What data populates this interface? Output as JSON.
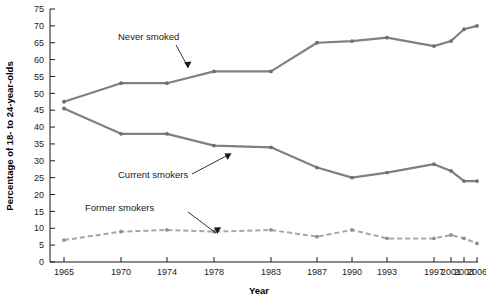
{
  "chart_data": {
    "type": "line",
    "title": "",
    "xlabel": "Year",
    "ylabel": "Percentage of 18- to 24-year-olds",
    "categories": [
      "1965",
      "1970",
      "1974",
      "1978",
      "1983",
      "1987",
      "1990",
      "1993",
      "1997",
      "2001",
      "2003",
      "2006"
    ],
    "ylim": [
      0,
      75
    ],
    "yticks": [
      0,
      5,
      10,
      15,
      20,
      25,
      30,
      35,
      40,
      45,
      50,
      55,
      60,
      65,
      70,
      75
    ],
    "grid": false,
    "legend_position": "inline-annotations",
    "series": [
      {
        "name": "Never smoked",
        "style": "solid",
        "color": "#808080",
        "values": [
          47.5,
          53,
          53,
          56.5,
          56.5,
          65,
          65.5,
          66.5,
          64,
          65.5,
          69,
          70
        ]
      },
      {
        "name": "Current smokers",
        "style": "solid",
        "color": "#808080",
        "values": [
          45.5,
          38,
          38,
          34.5,
          34,
          28,
          25,
          26.5,
          29,
          27,
          24,
          24
        ]
      },
      {
        "name": "Former smokers",
        "style": "dashed",
        "color": "#a6a6a6",
        "values": [
          6.5,
          9,
          9.5,
          9,
          9.5,
          7.5,
          9.5,
          7,
          7,
          8,
          7,
          5.5
        ]
      }
    ],
    "annotations": [
      {
        "text": "Never smoked",
        "series": "Never smoked",
        "points_to_year": "1983"
      },
      {
        "text": "Current smokers",
        "series": "Current smokers",
        "points_to_year": "1983"
      },
      {
        "text": "Former smokers",
        "series": "Former smokers",
        "points_to_year": "1983"
      }
    ]
  },
  "axis": {
    "x_title": "Year",
    "y_title": "Percentage of 18- to 24-year-olds"
  },
  "ticks": {
    "y": [
      "0",
      "5",
      "10",
      "15",
      "20",
      "25",
      "30",
      "35",
      "40",
      "45",
      "50",
      "55",
      "60",
      "65",
      "70",
      "75"
    ],
    "x": [
      "1965",
      "1970",
      "1974",
      "1978",
      "1983",
      "1987",
      "1990",
      "1993",
      "1997",
      "2001",
      "2003",
      "2006"
    ]
  },
  "labels": {
    "never": "Never smoked",
    "current": "Current smokers",
    "former": "Former smokers"
  },
  "colors": {
    "solid_line": "#808080",
    "dashed_line": "#a6a6a6",
    "text": "#1a1a1a",
    "background": "#ffffff"
  }
}
